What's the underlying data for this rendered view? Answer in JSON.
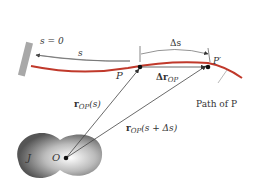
{
  "labels": {
    "s_zero": "s = 0",
    "s": "s",
    "delta_s": "Δs",
    "P": "P",
    "P_prime": "P′",
    "delta_r": "Δr",
    "delta_r_sub": "OP",
    "r_s": "r",
    "r_s_sub": "OP",
    "r_s_arg": "(s)",
    "r_sds": "r",
    "r_sds_sub": "OP",
    "r_sds_arg": "(s + Δs)",
    "path_label": "Path of P",
    "origin": "O",
    "frame": "J"
  },
  "colors": {
    "path": "#c0392b",
    "lines": "#444444",
    "wall": "#999999",
    "body_dark": "#555555",
    "body_light": "#f2f2f2"
  }
}
